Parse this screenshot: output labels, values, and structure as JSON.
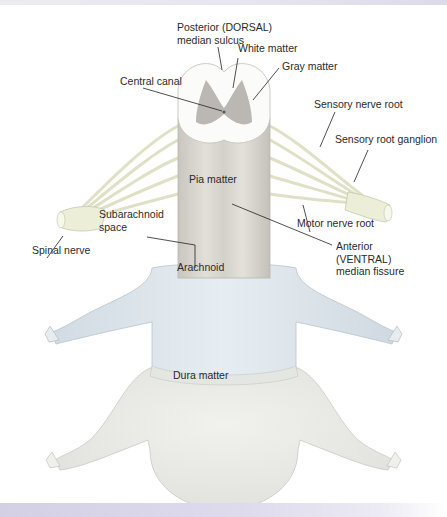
{
  "figure": {
    "title_strip_text": "",
    "labels": {
      "posterior_line1": "Posterior (DORSAL)",
      "posterior_line2": "median sulcus",
      "white_matter": "White matter",
      "gray_matter": "Gray matter",
      "central_canal": "Central canal",
      "sensory_nerve_root": "Sensory nerve root",
      "sensory_root_ganglion": "Sensory root ganglion",
      "pia_matter": "Pia matter",
      "subarachnoid_line1": "Subarachnoid",
      "subarachnoid_line2": "space",
      "spinal_nerve": "Spinal nerve",
      "motor_nerve_root": "Motor nerve root",
      "anterior_line1": "Anterior",
      "anterior_line2": "(VENTRAL)",
      "anterior_line3": "median fissure",
      "arachnoid": "Arachnoid",
      "dura_matter": "Dura matter"
    },
    "colors": {
      "nerve": "#eceed8",
      "pia": "#d9d6cf",
      "arachnoid": "#dfe6ec",
      "dura": "#e9eae6",
      "gray_matter": "#a6a29c",
      "leader": "#222222"
    }
  }
}
